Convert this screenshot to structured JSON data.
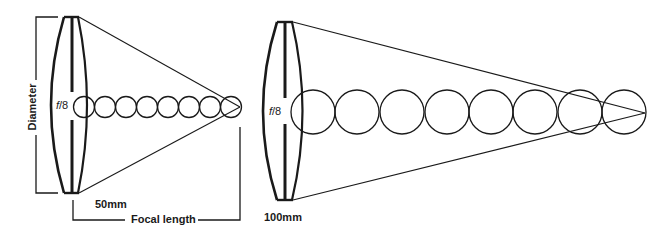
{
  "diagram": {
    "left_lens": {
      "fstop_prefix": "f",
      "fstop_value": "/8",
      "focal_label": "50mm",
      "circle_count": 8
    },
    "right_lens": {
      "fstop_prefix": "f",
      "fstop_value": "/8",
      "focal_label": "100mm",
      "circle_count": 8
    },
    "dimension_labels": {
      "diameter": "Diameter",
      "focal_length": "Focal length"
    },
    "colors": {
      "stroke": "#1a1a1a",
      "background": "#ffffff"
    }
  }
}
